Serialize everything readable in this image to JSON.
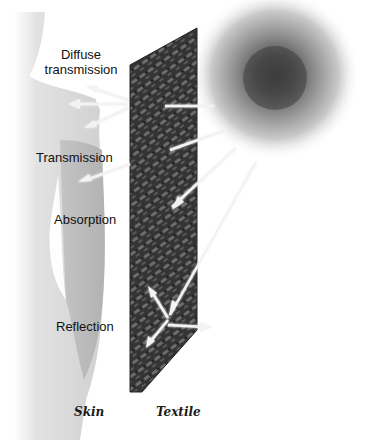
{
  "diagram": {
    "type": "light-interaction-schematic",
    "elements": {
      "light_source": {
        "name": "sun",
        "color": "#4a4a4a"
      },
      "textile": {
        "label": "Textile"
      },
      "skin": {
        "label": "Skin"
      }
    },
    "labels": {
      "diffuse_transmission_line1": "Diffuse",
      "diffuse_transmission_line2": "transmission",
      "transmission": "Transmission",
      "absorption": "Absorption",
      "reflection": "Reflection",
      "skin": "Skin",
      "textile": "Textile"
    },
    "colors": {
      "background": "#ffffff",
      "skin_light": "#e4e4e4",
      "skin_mid": "#bdbdbd",
      "textile_dark": "#2e2e2e",
      "textile_weave": "#6a6a6a",
      "ray": "#f5f5f5",
      "text": "#111111"
    }
  }
}
